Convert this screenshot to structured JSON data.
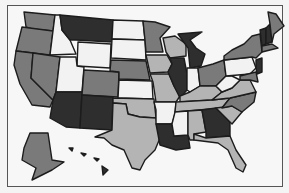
{
  "map": {
    "title": "United States map",
    "shades": {
      "dark": "#2e2e2e",
      "mid": "#7a7a7a",
      "light": "#b4b4b4",
      "white": "#f2f2f2"
    },
    "states": [
      {
        "id": "WA",
        "shade": "mid"
      },
      {
        "id": "OR",
        "shade": "mid"
      },
      {
        "id": "CA",
        "shade": "mid"
      },
      {
        "id": "ID",
        "shade": "white"
      },
      {
        "id": "NV",
        "shade": "mid"
      },
      {
        "id": "MT",
        "shade": "dark"
      },
      {
        "id": "WY",
        "shade": "white"
      },
      {
        "id": "UT",
        "shade": "white"
      },
      {
        "id": "AZ",
        "shade": "dark"
      },
      {
        "id": "CO",
        "shade": "mid"
      },
      {
        "id": "NM",
        "shade": "dark"
      },
      {
        "id": "ND",
        "shade": "white"
      },
      {
        "id": "SD",
        "shade": "white"
      },
      {
        "id": "NE",
        "shade": "mid"
      },
      {
        "id": "KS",
        "shade": "white"
      },
      {
        "id": "OK",
        "shade": "light"
      },
      {
        "id": "TX",
        "shade": "light"
      },
      {
        "id": "MN",
        "shade": "mid"
      },
      {
        "id": "IA",
        "shade": "light"
      },
      {
        "id": "MO",
        "shade": "light"
      },
      {
        "id": "AR",
        "shade": "white"
      },
      {
        "id": "LA",
        "shade": "dark"
      },
      {
        "id": "WI",
        "shade": "light"
      },
      {
        "id": "IL",
        "shade": "dark"
      },
      {
        "id": "MI",
        "shade": "dark"
      },
      {
        "id": "IN",
        "shade": "white"
      },
      {
        "id": "OH",
        "shade": "mid"
      },
      {
        "id": "KY",
        "shade": "light"
      },
      {
        "id": "TN",
        "shade": "light"
      },
      {
        "id": "MS",
        "shade": "white"
      },
      {
        "id": "AL",
        "shade": "light"
      },
      {
        "id": "GA",
        "shade": "dark"
      },
      {
        "id": "FL",
        "shade": "light"
      },
      {
        "id": "SC",
        "shade": "light"
      },
      {
        "id": "NC",
        "shade": "mid"
      },
      {
        "id": "VA",
        "shade": "light"
      },
      {
        "id": "WV",
        "shade": "white"
      },
      {
        "id": "PA",
        "shade": "white"
      },
      {
        "id": "NY",
        "shade": "mid"
      },
      {
        "id": "VT",
        "shade": "dark"
      },
      {
        "id": "NH",
        "shade": "dark"
      },
      {
        "id": "ME",
        "shade": "mid"
      },
      {
        "id": "MA",
        "shade": "mid"
      },
      {
        "id": "NJ",
        "shade": "dark"
      },
      {
        "id": "MD",
        "shade": "mid"
      },
      {
        "id": "AK",
        "shade": "mid"
      },
      {
        "id": "HI",
        "shade": "dark"
      }
    ]
  }
}
